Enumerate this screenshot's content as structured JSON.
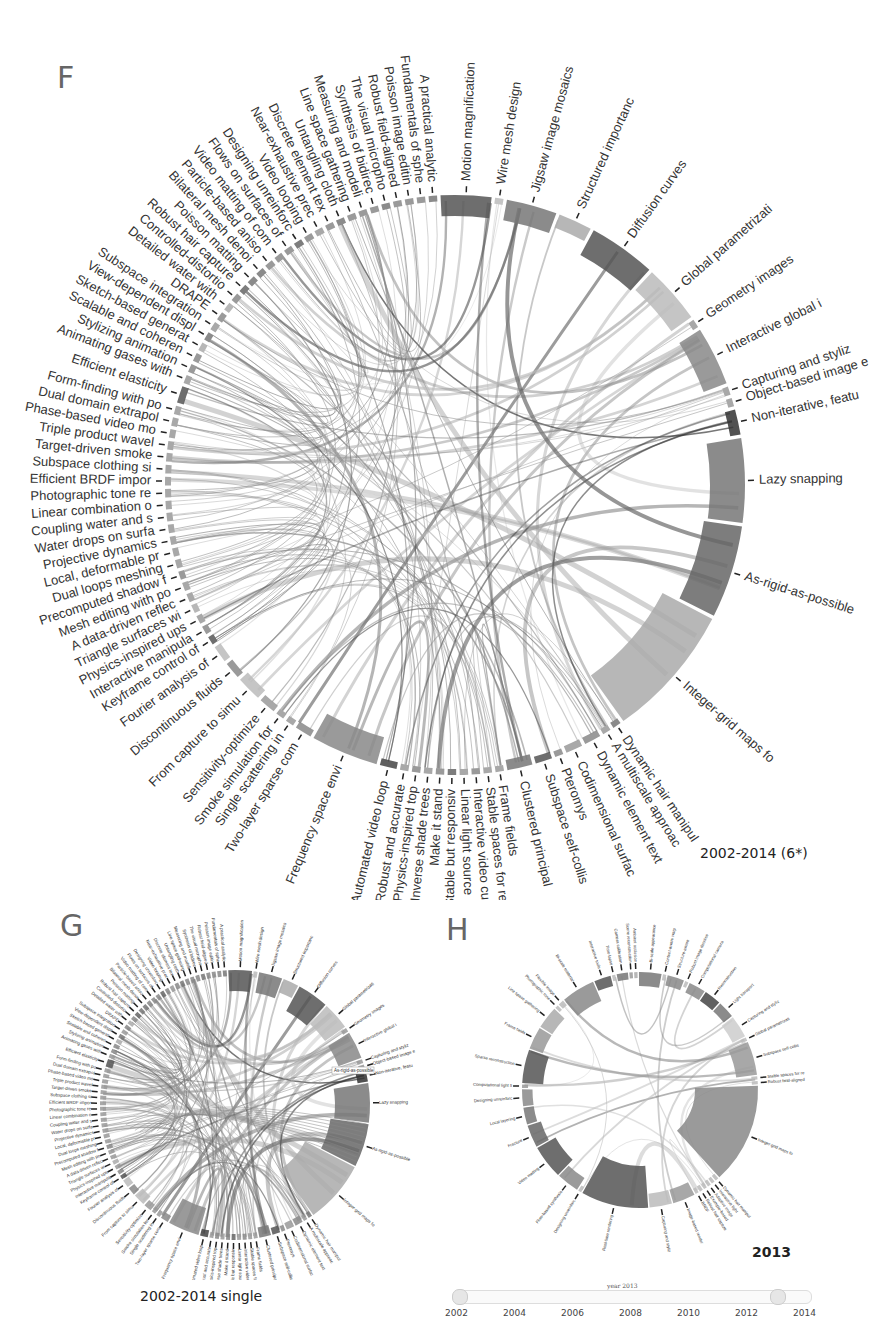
{
  "chart_data": [
    {
      "panel": "F",
      "type": "chord",
      "caption": "2002-2014 (6*)",
      "labels": [
        "Motion magnification",
        "Wire mesh design",
        "Jigsaw image mosaics",
        "Structured importanc",
        "Diffusion curves",
        "Global parametrizati",
        "Geometry images",
        "Interactive global i",
        "Capturing and styliz",
        "Object-based image e",
        "Non-iterative, featu",
        "Lazy snapping",
        "As-rigid-as-possible",
        "Integer-grid maps fo",
        "Dynamic hair manipul",
        "A multiscale approac",
        "Dynamic element text",
        "Codimensional surfac",
        "Pteromys",
        "Subspace self-collis",
        "Clustered principal",
        "Frame fields",
        "Stable spaces for re",
        "Interactive video cu",
        "Linear light source",
        "Stable but responsiv",
        "Make it stand",
        "Inverse shade trees",
        "Physics-inspired top",
        "Robust and accurate",
        "Automated video loop",
        "Frequency space envi",
        "Two-layer sparse com",
        "Single scattering in",
        "Smoke simulation for",
        "Sensitivity-optimize",
        "From capture to simu",
        "Discontinuous fluids",
        "Fourier analysis of",
        "Keyframe control of",
        "Interactive manipula",
        "Physics-inspired ups",
        "Triangle surfaces wi",
        "A data-driven reflec",
        "Mesh editing with po",
        "Precomputed shadow f",
        "Dual loops meshing",
        "Local, deformable pr",
        "Projective dynamics",
        "Water drops on surfa",
        "Coupling water and s",
        "Linear combination o",
        "Photographic tone re",
        "Efficient BRDF impor",
        "Subspace clothing si",
        "Target-driven smoke",
        "Triple product wavel",
        "Phase-based video mo",
        "Dual domain extrapol",
        "Form-finding with po",
        "Efficient elasticity",
        "Animating gases with",
        "Stylizing animation",
        "Scalable and coheren",
        "Sketch-based generat",
        "View-dependent displ",
        "Subspace integration",
        "DRAPE",
        "Detailed water with",
        "Controlled-distortio",
        "Robust hair capture",
        "Poisson matting",
        "Bilateral mesh denoi",
        "Particle-based aniso",
        "Video matting of com",
        "Flows on surfaces of",
        "Designing unreinforc",
        "Video looping",
        "Near-exhaustive prec",
        "Discrete element tex",
        "Untangling cloth",
        "Line space gathering",
        "Measuring and modeli",
        "Synthesis of bidirec",
        "The visual micropho",
        "Robust field-aligned",
        "Poisson image editin",
        "Fundamentals of sphe",
        "A practical analytic"
      ],
      "weights": [
        3,
        0.5,
        3,
        2,
        4,
        3.5,
        0.5,
        3.5,
        0.5,
        0.5,
        1.5,
        5,
        5.5,
        8,
        0.5,
        0.5,
        1,
        1,
        0.5,
        1,
        1.5,
        0.5,
        0.5,
        0.5,
        0.5,
        0.5,
        0.5,
        0.5,
        0.5,
        0.5,
        1,
        4,
        1,
        0.5,
        0.5,
        1,
        1.5,
        1,
        1,
        0.5,
        0.5,
        0.5,
        0.5,
        0.5,
        0.5,
        0.5,
        0.5,
        0.5,
        0.5,
        0.5,
        0.5,
        0.5,
        0.5,
        0.5,
        0.5,
        0.5,
        0.5,
        0.5,
        0.5,
        0.5,
        1,
        0.5,
        0.5,
        0.5,
        0.5,
        0.5,
        0.5,
        0.5,
        0.5,
        0.5,
        0.5,
        0.5,
        0.5,
        0.5,
        0.5,
        0.5,
        0.5,
        0.5,
        0.5,
        0.5,
        0.5,
        0.5,
        0.5,
        0.5,
        0.5,
        0.5,
        0.5,
        0.5,
        0.5
      ],
      "shades": [
        "#555",
        "#bbb",
        "#777",
        "#aaa",
        "#555",
        "#bbb",
        "#999",
        "#888",
        "#999",
        "#999",
        "#333",
        "#777",
        "#666",
        "#aaa",
        "#777",
        "#999",
        "#888",
        "#999",
        "#888",
        "#555",
        "#777",
        "#999",
        "#999",
        "#888",
        "#999",
        "#666",
        "#888",
        "#999",
        "#888",
        "#999",
        "#444",
        "#888",
        "#888",
        "#999",
        "#999",
        "#999",
        "#bbb",
        "#888",
        "#bbb",
        "#555",
        "#888",
        "#999",
        "#aaa",
        "#999",
        "#999",
        "#888",
        "#999",
        "#999",
        "#999",
        "#999",
        "#999",
        "#999",
        "#999",
        "#999",
        "#999",
        "#999",
        "#999",
        "#999",
        "#999",
        "#999",
        "#555",
        "#999",
        "#888",
        "#888",
        "#aaa",
        "#777",
        "#999",
        "#888",
        "#aaa",
        "#888",
        "#666",
        "#777",
        "#777",
        "#888",
        "#888",
        "#888",
        "#666",
        "#888",
        "#999",
        "#888",
        "#777",
        "#888",
        "#888",
        "#888",
        "#777",
        "#888",
        "#888",
        "#888",
        "#777"
      ]
    },
    {
      "panel": "G",
      "type": "chord",
      "caption": "2002-2014 single",
      "highlighted": "As-rigid-as-possible",
      "tooltip": "As-rigid-as-possible"
    },
    {
      "panel": "H",
      "type": "chord",
      "caption": "2013",
      "visible_labels": [
        "Designing unreinforc",
        "Computational light fi",
        "Sparse reconstruction",
        "Frame fields",
        "Dynamic hair manipul",
        "Integer-grid maps fo",
        "Capturing and styliz"
      ]
    }
  ],
  "panels": {
    "f": {
      "letter": "F",
      "caption": "2002-2014 (6*)"
    },
    "g": {
      "letter": "G",
      "caption": "2002-2014 single",
      "tooltip": "As-rigid-as-possible"
    },
    "h": {
      "letter": "H",
      "caption": "2013"
    }
  },
  "slider": {
    "title": "year 2013",
    "ticks": [
      "2002",
      "2004",
      "2006",
      "2008",
      "2010",
      "2012",
      "2014"
    ],
    "min": 2002,
    "max": 2014,
    "value_start": 2002,
    "value_end": 2013
  }
}
